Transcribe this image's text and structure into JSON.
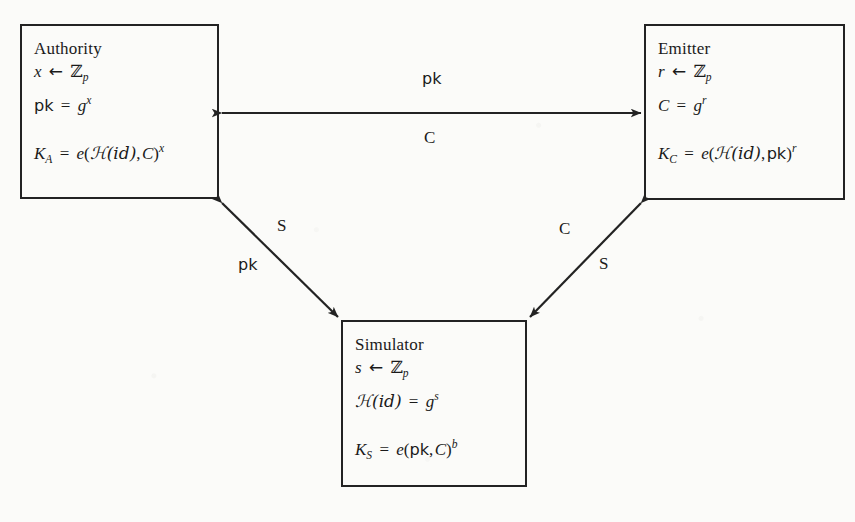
{
  "figure": {
    "type": "protocol-diagram",
    "background_color": "#fbfbf9",
    "ink_color": "#232323"
  },
  "nodes": [
    {
      "id": "authority",
      "title": "Authority",
      "sample": {
        "var": "x",
        "arrow": "←",
        "set": "ℤ",
        "set_sub": "p"
      },
      "derive": {
        "lhs": "pk",
        "eq": "=",
        "base": "g",
        "exp": "x"
      },
      "key": {
        "name": "K",
        "name_sub": "A",
        "eq": "=",
        "pairing": "e",
        "arg1": "ℋ(id)",
        "arg2": "C",
        "exp": "x"
      }
    },
    {
      "id": "emitter",
      "title": "Emitter",
      "sample": {
        "var": "r",
        "arrow": "←",
        "set": "ℤ",
        "set_sub": "p"
      },
      "derive": {
        "lhs": "C",
        "eq": "=",
        "base": "g",
        "exp": "r"
      },
      "key": {
        "name": "K",
        "name_sub": "C",
        "eq": "=",
        "pairing": "e",
        "arg1": "ℋ(id)",
        "arg2": "pk",
        "exp": "r"
      }
    },
    {
      "id": "simulator",
      "title": "Simulator",
      "sample": {
        "var": "s",
        "arrow": "←",
        "set": "ℤ",
        "set_sub": "p"
      },
      "derive": {
        "lhs": "ℋ(id)",
        "eq": "=",
        "base": "g",
        "exp": "s"
      },
      "key": {
        "name": "K",
        "name_sub": "S",
        "eq": "=",
        "pairing": "e",
        "arg1": "pk",
        "arg2": "C",
        "exp": "b"
      }
    }
  ],
  "edges": [
    {
      "id": "authority-emitter",
      "from": "authority",
      "to": "emitter",
      "style": "double-headed",
      "label_primary": "pk",
      "label_secondary": "C"
    },
    {
      "id": "authority-simulator",
      "from": "authority",
      "to": "simulator",
      "style": "double-headed",
      "label_primary": "S",
      "label_secondary": "pk"
    },
    {
      "id": "emitter-simulator",
      "from": "emitter",
      "to": "simulator",
      "style": "double-headed",
      "label_primary": "C",
      "label_secondary": "S"
    }
  ]
}
